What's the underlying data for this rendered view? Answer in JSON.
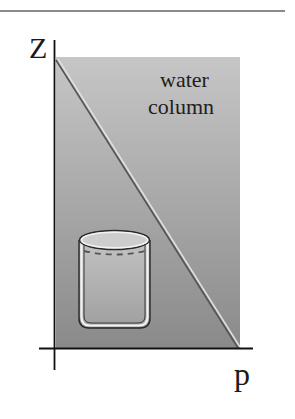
{
  "diagram": {
    "axes": {
      "vertical": {
        "label": "z"
      },
      "horizontal": {
        "label": "p"
      }
    },
    "region": {
      "label_line1": "water",
      "label_line2": "column",
      "gradient_top": "#c6c6c6",
      "gradient_bottom": "#8a8a8a"
    },
    "pressure_line": {
      "description": "linear pressure increase with depth",
      "stroke": "#555555"
    },
    "beaker": {
      "description": "glass beaker with dashed water level"
    },
    "rule_color": "#8a8a8a"
  }
}
